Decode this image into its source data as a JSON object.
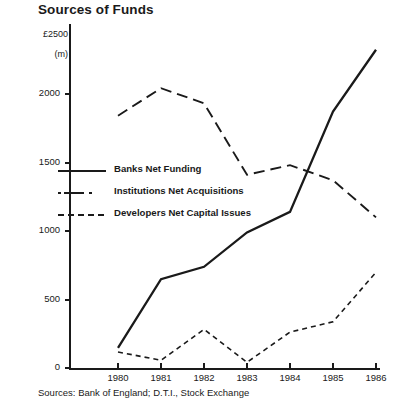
{
  "chart_data": {
    "type": "line",
    "title": "Sources of Funds",
    "xlabel": "",
    "ylabel": "£2500\n(m)",
    "unit_label_top": "£2500",
    "unit_label_bottom": "(m)",
    "categories": [
      "1980",
      "1981",
      "1982",
      "1983",
      "1984",
      "1985",
      "1986"
    ],
    "x": [
      1980,
      1981,
      1982,
      1983,
      1984,
      1985,
      1986
    ],
    "ylim": [
      0,
      2500
    ],
    "yticks": [
      0,
      500,
      1000,
      1500,
      2000,
      2500
    ],
    "ytick_labels": [
      "0",
      "500",
      "1000",
      "1500",
      "2000",
      "£2500"
    ],
    "grid": false,
    "legend_position": "center-left",
    "series": [
      {
        "name": "Banks Net Funding",
        "style": "solid",
        "values": [
          150,
          650,
          740,
          990,
          1140,
          1870,
          2320
        ]
      },
      {
        "name": "Institutions Net Acquisitions",
        "style": "dash-dot",
        "values": [
          1840,
          2040,
          1930,
          1410,
          1480,
          1370,
          1100
        ]
      },
      {
        "name": "Developers Net Capital Issues",
        "style": "dotted",
        "values": [
          120,
          60,
          285,
          45,
          265,
          340,
          700
        ]
      }
    ],
    "source_note": "Sources: Bank of England; D.T.I., Stock Exchange",
    "colors": {
      "ink": "#1a1a1a",
      "background": "#ffffff"
    }
  }
}
